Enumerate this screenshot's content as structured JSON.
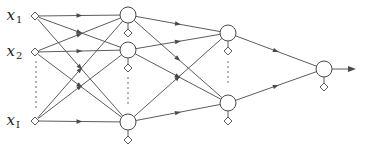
{
  "colors": {
    "stroke": "#4a4a4a",
    "text": "#222222",
    "background": "#ffffff"
  },
  "input_layer": {
    "labels": [
      {
        "base": "x",
        "sub": "1"
      },
      {
        "base": "x",
        "sub": "2"
      },
      {
        "base": "x",
        "sub": "I"
      }
    ],
    "nodes": [
      {
        "x": 35,
        "y": 16
      },
      {
        "x": 35,
        "y": 52
      },
      {
        "x": 35,
        "y": 121
      }
    ],
    "ellipsis": {
      "x": 36,
      "y1": 62,
      "y2": 108
    },
    "node_shape": "diamond"
  },
  "hidden_layer_1": {
    "nodes": [
      {
        "x": 128,
        "y": 15
      },
      {
        "x": 128,
        "y": 50
      },
      {
        "x": 128,
        "y": 122
      }
    ],
    "bias_offset": 18,
    "ellipsis": {
      "x": 128,
      "y1": 78,
      "y2": 104
    },
    "node_shape": "circle"
  },
  "hidden_layer_2": {
    "nodes": [
      {
        "x": 228,
        "y": 33
      },
      {
        "x": 228,
        "y": 103
      }
    ],
    "bias_offset": 18,
    "ellipsis": {
      "x": 228,
      "y1": 62,
      "y2": 86
    },
    "node_shape": "circle"
  },
  "output_layer": {
    "nodes": [
      {
        "x": 324,
        "y": 69
      }
    ],
    "bias_offset": 18,
    "output_arrow": {
      "x_end": 356
    },
    "node_shape": "circle"
  },
  "connectivity": "fully-connected",
  "edge_arrow_position": "midpoint"
}
